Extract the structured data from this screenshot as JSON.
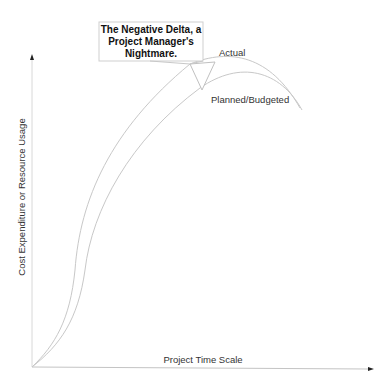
{
  "diagram": {
    "callout": {
      "lines": [
        "The Negative Delta, a",
        "Project Manager's",
        "Nightmare."
      ]
    },
    "curves": [
      {
        "name": "actual",
        "label": "Actual"
      },
      {
        "name": "planned",
        "label": "Planned/Budgeted"
      }
    ],
    "x_axis_label": "Project Time Scale",
    "y_axis_label": "Cost Expenditure or Resource Usage",
    "colors": {
      "axis": "#c4c4c4",
      "curve": "#c8c8c8",
      "text": "#333333"
    }
  }
}
